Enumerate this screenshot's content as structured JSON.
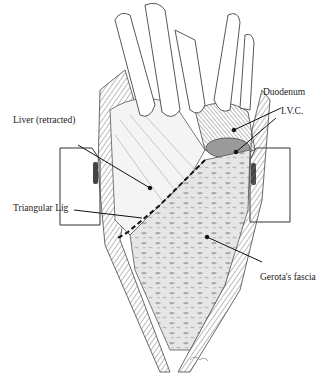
{
  "figure": {
    "labels": {
      "liver": "Liver (retracted)",
      "duodenum": "Duodenum",
      "ivc": "I.V.C.",
      "triangular_lig": "Triangular Lig",
      "gerota": "Gerota's fascia"
    },
    "colors": {
      "ink": "#222222",
      "shade_dark": "#555555",
      "shade_mid": "#8a8a8a",
      "shade_light": "#c8c8c8",
      "background": "#ffffff"
    }
  }
}
